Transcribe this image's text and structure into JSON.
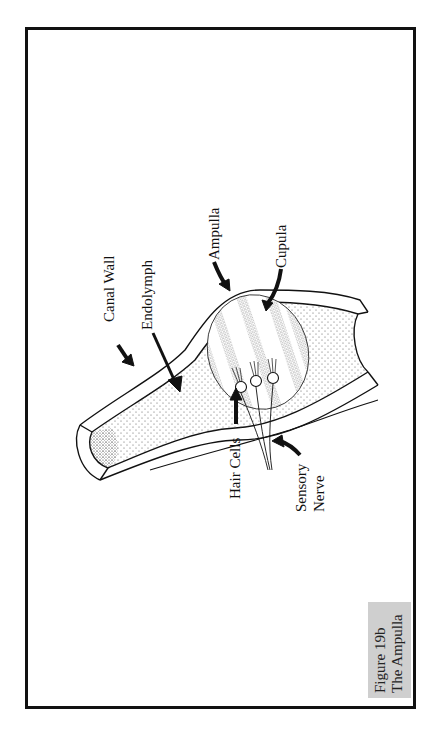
{
  "figure": {
    "number_label": "Figure 19b",
    "title": "The Ampulla",
    "orientation": "rotated 90° counter-clockwise"
  },
  "labels": {
    "canal_wall": "Canal Wall",
    "endolymph": "Endolymph",
    "ampulla": "Ampulla",
    "cupula": "Cupula",
    "hair_cells": "Hair Cells",
    "sensory_nerve_line1": "Sensory",
    "sensory_nerve_line2": "Nerve"
  },
  "colors": {
    "ink": "#111111",
    "stipple": "#555555",
    "caption_bg": "#cfcfcf",
    "background": "#ffffff"
  }
}
